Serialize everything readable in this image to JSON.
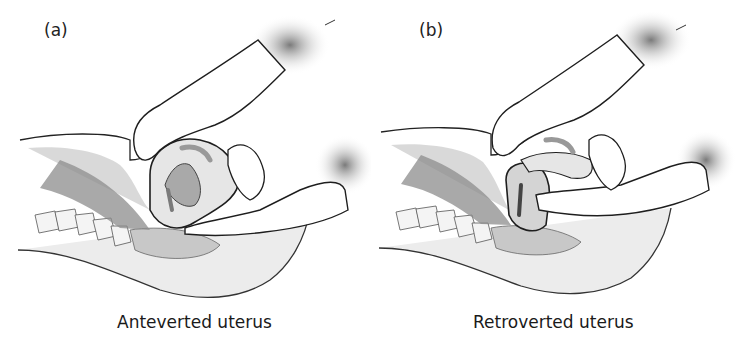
{
  "figure": {
    "panels": [
      {
        "label": "(a)",
        "caption": "Anteverted uterus",
        "elements": [
          "abdominal-hand",
          "vaginal-hand",
          "uterus-anteverted",
          "spine",
          "bladder",
          "pelvic-outline"
        ]
      },
      {
        "label": "(b)",
        "caption": "Retroverted uterus",
        "elements": [
          "abdominal-hand",
          "vaginal-hand",
          "uterus-retroverted",
          "spine",
          "bladder",
          "pelvic-outline"
        ]
      }
    ],
    "colors": {
      "outline": "#1e1e1e",
      "shade_dark": "#8a8a8a",
      "shade_mid": "#b8b8b8",
      "shade_light": "#dedede",
      "background": "#ffffff"
    }
  }
}
